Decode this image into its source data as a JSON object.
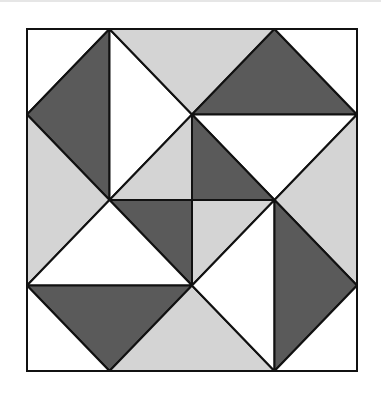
{
  "diagram": {
    "type": "quilt-block",
    "grid": {
      "cols": 4,
      "rows": 4,
      "x": [
        27,
        109.5,
        192,
        274.5,
        357
      ],
      "y": [
        29,
        114.5,
        200,
        285.5,
        371
      ]
    },
    "colors": {
      "white": "#ffffff",
      "light": "#d4d4d4",
      "dark": "#5a5a5a",
      "stroke": "#111111"
    },
    "triangles": [
      {
        "id": "tl-corner",
        "tone": "white",
        "pts": [
          [
            0,
            0
          ],
          [
            1,
            0
          ],
          [
            0,
            1
          ]
        ]
      },
      {
        "id": "tl-dark",
        "tone": "dark",
        "pts": [
          [
            1,
            0
          ],
          [
            0,
            1
          ],
          [
            1,
            2
          ]
        ]
      },
      {
        "id": "left-light",
        "tone": "light",
        "pts": [
          [
            0,
            1
          ],
          [
            1,
            2
          ],
          [
            0,
            3
          ]
        ]
      },
      {
        "id": "top-left-white",
        "tone": "white",
        "pts": [
          [
            1,
            0
          ],
          [
            2,
            1
          ],
          [
            1,
            2
          ]
        ]
      },
      {
        "id": "top-light",
        "tone": "light",
        "pts": [
          [
            1,
            0
          ],
          [
            3,
            0
          ],
          [
            2,
            1
          ]
        ]
      },
      {
        "id": "tr-dark",
        "tone": "dark",
        "pts": [
          [
            3,
            0
          ],
          [
            2,
            1
          ],
          [
            4,
            1
          ]
        ]
      },
      {
        "id": "tr-corner",
        "tone": "white",
        "pts": [
          [
            3,
            0
          ],
          [
            4,
            0
          ],
          [
            4,
            1
          ]
        ]
      },
      {
        "id": "right-top-white",
        "tone": "white",
        "pts": [
          [
            2,
            1
          ],
          [
            4,
            1
          ],
          [
            3,
            2
          ]
        ]
      },
      {
        "id": "right-light",
        "tone": "light",
        "pts": [
          [
            4,
            1
          ],
          [
            3,
            2
          ],
          [
            4,
            3
          ]
        ]
      },
      {
        "id": "center-nw",
        "tone": "light",
        "pts": [
          [
            1,
            2
          ],
          [
            2,
            1
          ],
          [
            2,
            2
          ]
        ]
      },
      {
        "id": "center-ne",
        "tone": "dark",
        "pts": [
          [
            2,
            1
          ],
          [
            2,
            2
          ],
          [
            3,
            2
          ]
        ]
      },
      {
        "id": "center-sw",
        "tone": "dark",
        "pts": [
          [
            1,
            2
          ],
          [
            2,
            2
          ],
          [
            2,
            3
          ]
        ]
      },
      {
        "id": "center-se",
        "tone": "light",
        "pts": [
          [
            2,
            2
          ],
          [
            3,
            2
          ],
          [
            2,
            3
          ]
        ]
      },
      {
        "id": "left-bottom-white",
        "tone": "white",
        "pts": [
          [
            1,
            2
          ],
          [
            2,
            3
          ],
          [
            0,
            3
          ]
        ]
      },
      {
        "id": "bl-dark",
        "tone": "dark",
        "pts": [
          [
            0,
            3
          ],
          [
            2,
            3
          ],
          [
            1,
            4
          ]
        ]
      },
      {
        "id": "bl-corner",
        "tone": "white",
        "pts": [
          [
            0,
            3
          ],
          [
            0,
            4
          ],
          [
            1,
            4
          ]
        ]
      },
      {
        "id": "bottom-light",
        "tone": "light",
        "pts": [
          [
            1,
            4
          ],
          [
            2,
            3
          ],
          [
            3,
            4
          ]
        ]
      },
      {
        "id": "bottom-right-white",
        "tone": "white",
        "pts": [
          [
            2,
            3
          ],
          [
            3,
            2
          ],
          [
            3,
            4
          ]
        ]
      },
      {
        "id": "br-dark",
        "tone": "dark",
        "pts": [
          [
            3,
            2
          ],
          [
            4,
            3
          ],
          [
            3,
            4
          ]
        ]
      },
      {
        "id": "br-corner",
        "tone": "white",
        "pts": [
          [
            4,
            3
          ],
          [
            4,
            4
          ],
          [
            3,
            4
          ]
        ]
      }
    ]
  }
}
